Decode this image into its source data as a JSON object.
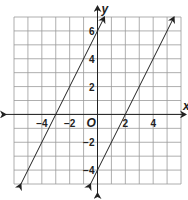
{
  "chart_data": {
    "type": "line",
    "title": "",
    "xlabel": "x",
    "ylabel": "y",
    "origin_label": "O",
    "xlim": [
      -6,
      6
    ],
    "ylim": [
      -5,
      7
    ],
    "grid": true,
    "x_tick_labels": [
      {
        "value": -4,
        "label": "−4"
      },
      {
        "value": -2,
        "label": "−2"
      },
      {
        "value": 2,
        "label": "2"
      },
      {
        "value": 4,
        "label": "4"
      }
    ],
    "y_tick_labels": [
      {
        "value": 6,
        "label": "6"
      },
      {
        "value": 4,
        "label": "4"
      },
      {
        "value": 2,
        "label": "2"
      },
      {
        "value": -2,
        "label": "−2"
      },
      {
        "value": -4,
        "label": "−4"
      }
    ],
    "series": [
      {
        "name": "line-1",
        "equation": "y = 2x + 6",
        "slope": 2,
        "intercept": 6,
        "x_intercept": -3,
        "arrows": "both"
      },
      {
        "name": "line-2",
        "equation": "y = 2x - 4",
        "slope": 2,
        "intercept": -4,
        "x_intercept": 2,
        "arrows": "both"
      }
    ]
  }
}
